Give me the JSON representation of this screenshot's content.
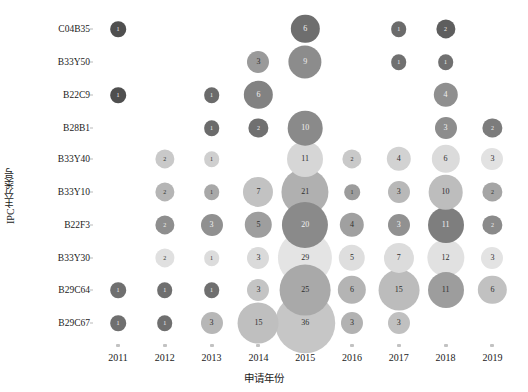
{
  "chart_data": {
    "type": "scatter",
    "title": "",
    "xlabel": "申请年份",
    "ylabel": "IPC主分类号",
    "grid": false,
    "legend": "none",
    "categories": [
      "2011",
      "2012",
      "2013",
      "2014",
      "2015",
      "2016",
      "2017",
      "2018",
      "2019"
    ],
    "y_categories": [
      "C04B35",
      "B33Y50",
      "B22C9",
      "B28B1",
      "B33Y40",
      "B33Y10",
      "B22F3",
      "B33Y30",
      "B29C64",
      "B29C67"
    ],
    "points": [
      {
        "y": "C04B35",
        "x": "2011",
        "value": 1,
        "color": "#4f4f4f"
      },
      {
        "y": "C04B35",
        "x": "2015",
        "value": 6,
        "color": "#6e6e6e"
      },
      {
        "y": "C04B35",
        "x": "2017",
        "value": 1,
        "color": "#6b6b6b"
      },
      {
        "y": "C04B35",
        "x": "2018",
        "value": 2,
        "color": "#5e5e5e"
      },
      {
        "y": "B33Y50",
        "x": "2014",
        "value": 3,
        "color": "#9a9a9a"
      },
      {
        "y": "B33Y50",
        "x": "2015",
        "value": 9,
        "color": "#8c8c8c"
      },
      {
        "y": "B33Y50",
        "x": "2017",
        "value": 1,
        "color": "#707070"
      },
      {
        "y": "B33Y50",
        "x": "2018",
        "value": 1,
        "color": "#707070"
      },
      {
        "y": "B22C9",
        "x": "2011",
        "value": 1,
        "color": "#4f4f4f"
      },
      {
        "y": "B22C9",
        "x": "2013",
        "value": 1,
        "color": "#6b6b6b"
      },
      {
        "y": "B22C9",
        "x": "2014",
        "value": 6,
        "color": "#828282"
      },
      {
        "y": "B22C9",
        "x": "2018",
        "value": 4,
        "color": "#8f8f8f"
      },
      {
        "y": "B28B1",
        "x": "2013",
        "value": 1,
        "color": "#6b6b6b"
      },
      {
        "y": "B28B1",
        "x": "2014",
        "value": 2,
        "color": "#707070"
      },
      {
        "y": "B28B1",
        "x": "2015",
        "value": 10,
        "color": "#8a8a8a"
      },
      {
        "y": "B28B1",
        "x": "2018",
        "value": 3,
        "color": "#8d8d8d"
      },
      {
        "y": "B28B1",
        "x": "2019",
        "value": 2,
        "color": "#7c7c7c"
      },
      {
        "y": "B33Y40",
        "x": "2012",
        "value": 2,
        "color": "#c9c9c9"
      },
      {
        "y": "B33Y40",
        "x": "2013",
        "value": 1,
        "color": "#cfcfcf"
      },
      {
        "y": "B33Y40",
        "x": "2015",
        "value": 11,
        "color": "#d6d6d6"
      },
      {
        "y": "B33Y40",
        "x": "2016",
        "value": 2,
        "color": "#c9c9c9"
      },
      {
        "y": "B33Y40",
        "x": "2017",
        "value": 4,
        "color": "#d2d2d2"
      },
      {
        "y": "B33Y40",
        "x": "2018",
        "value": 6,
        "color": "#dbdbdb"
      },
      {
        "y": "B33Y40",
        "x": "2019",
        "value": 3,
        "color": "#e2e2e2"
      },
      {
        "y": "B33Y10",
        "x": "2012",
        "value": 2,
        "color": "#b5b5b5"
      },
      {
        "y": "B33Y10",
        "x": "2013",
        "value": 1,
        "color": "#a8a8a8"
      },
      {
        "y": "B33Y10",
        "x": "2014",
        "value": 7,
        "color": "#c2c2c2"
      },
      {
        "y": "B33Y10",
        "x": "2015",
        "value": 21,
        "color": "#b0b0b0"
      },
      {
        "y": "B33Y10",
        "x": "2016",
        "value": 1,
        "color": "#9c9c9c"
      },
      {
        "y": "B33Y10",
        "x": "2017",
        "value": 3,
        "color": "#b8b8b8"
      },
      {
        "y": "B33Y10",
        "x": "2018",
        "value": 10,
        "color": "#bdbdbd"
      },
      {
        "y": "B33Y10",
        "x": "2019",
        "value": 2,
        "color": "#a5a5a5"
      },
      {
        "y": "B22F3",
        "x": "2012",
        "value": 2,
        "color": "#8e8e8e"
      },
      {
        "y": "B22F3",
        "x": "2013",
        "value": 3,
        "color": "#909090"
      },
      {
        "y": "B22F3",
        "x": "2014",
        "value": 5,
        "color": "#9e9e9e"
      },
      {
        "y": "B22F3",
        "x": "2015",
        "value": 20,
        "color": "#8a8a8a"
      },
      {
        "y": "B22F3",
        "x": "2016",
        "value": 4,
        "color": "#a0a0a0"
      },
      {
        "y": "B22F3",
        "x": "2017",
        "value": 3,
        "color": "#919191"
      },
      {
        "y": "B22F3",
        "x": "2018",
        "value": 11,
        "color": "#7e7e7e"
      },
      {
        "y": "B22F3",
        "x": "2019",
        "value": 2,
        "color": "#8a8a8a"
      },
      {
        "y": "B33Y30",
        "x": "2012",
        "value": 2,
        "color": "#e0e0e0"
      },
      {
        "y": "B33Y30",
        "x": "2013",
        "value": 1,
        "color": "#dcdcdc"
      },
      {
        "y": "B33Y30",
        "x": "2014",
        "value": 3,
        "color": "#dadada"
      },
      {
        "y": "B33Y30",
        "x": "2015",
        "value": 29,
        "color": "#e4e4e4"
      },
      {
        "y": "B33Y30",
        "x": "2016",
        "value": 5,
        "color": "#dedede"
      },
      {
        "y": "B33Y30",
        "x": "2017",
        "value": 7,
        "color": "#dcdcdc"
      },
      {
        "y": "B33Y30",
        "x": "2018",
        "value": 12,
        "color": "#e1e1e1"
      },
      {
        "y": "B33Y30",
        "x": "2019",
        "value": 3,
        "color": "#e3e3e3"
      },
      {
        "y": "B29C64",
        "x": "2011",
        "value": 1,
        "color": "#6f6f6f"
      },
      {
        "y": "B29C64",
        "x": "2012",
        "value": 1,
        "color": "#6f6f6f"
      },
      {
        "y": "B29C64",
        "x": "2013",
        "value": 1,
        "color": "#6f6f6f"
      },
      {
        "y": "B29C64",
        "x": "2014",
        "value": 3,
        "color": "#c4c4c4"
      },
      {
        "y": "B29C64",
        "x": "2015",
        "value": 25,
        "color": "#a9a9a9"
      },
      {
        "y": "B29C64",
        "x": "2016",
        "value": 6,
        "color": "#b4b4b4"
      },
      {
        "y": "B29C64",
        "x": "2017",
        "value": 15,
        "color": "#bcbcbc"
      },
      {
        "y": "B29C64",
        "x": "2018",
        "value": 11,
        "color": "#9d9d9d"
      },
      {
        "y": "B29C64",
        "x": "2019",
        "value": 6,
        "color": "#c1c1c1"
      },
      {
        "y": "B29C67",
        "x": "2011",
        "value": 1,
        "color": "#6f6f6f"
      },
      {
        "y": "B29C67",
        "x": "2012",
        "value": 1,
        "color": "#6f6f6f"
      },
      {
        "y": "B29C67",
        "x": "2013",
        "value": 3,
        "color": "#b7b7b7"
      },
      {
        "y": "B29C67",
        "x": "2014",
        "value": 15,
        "color": "#bfbfbf"
      },
      {
        "y": "B29C67",
        "x": "2015",
        "value": 36,
        "color": "#c6c6c6"
      },
      {
        "y": "B29C67",
        "x": "2016",
        "value": 3,
        "color": "#b2b2b2"
      },
      {
        "y": "B29C67",
        "x": "2017",
        "value": 3,
        "color": "#c0c0c0"
      }
    ]
  },
  "axes": {
    "x_title": "申请年份",
    "y_title": "IPC主分类号",
    "x_ticks": [
      "2011",
      "2012",
      "2013",
      "2014",
      "2015",
      "2016",
      "2017",
      "2018",
      "2019"
    ],
    "y_ticks": [
      "C04B35",
      "B33Y50",
      "B22C9",
      "B28B1",
      "B33Y40",
      "B33Y10",
      "B22F3",
      "B33Y30",
      "B29C64",
      "B29C67"
    ]
  }
}
